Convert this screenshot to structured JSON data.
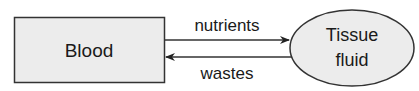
{
  "diagram": {
    "nodes": {
      "blood": {
        "label": "Blood",
        "shape": "rectangle",
        "fill": "#ececec"
      },
      "tissue_fluid": {
        "label_line1": "Tissue",
        "label_line2": "fluid",
        "shape": "ellipse",
        "fill": "#ececec"
      }
    },
    "edges": [
      {
        "from": "Blood",
        "to": "Tissue fluid",
        "label": "nutrients"
      },
      {
        "from": "Tissue fluid",
        "to": "Blood",
        "label": "wastes"
      }
    ],
    "colors": {
      "stroke": "#333333",
      "text": "#1a1a1a",
      "fill": "#ececec"
    }
  }
}
